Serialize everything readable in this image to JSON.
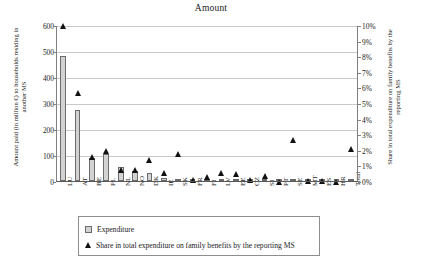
{
  "chart_data": {
    "type": "bar",
    "title": "Amount",
    "xlabel": "",
    "ylabel": "Amount paid (in million €) to households residing in another MS",
    "y2label": "Share in total expenditure on family benefits by the reporting MS",
    "grid": true,
    "legend_position": "bottom",
    "ylim": [
      0,
      600
    ],
    "y2lim": [
      0,
      10
    ],
    "yticks": [
      "0",
      "100",
      "200",
      "300",
      "400",
      "500",
      "600"
    ],
    "y2ticks": [
      "0%",
      "1%",
      "2%",
      "3%",
      "4%",
      "5%",
      "6%",
      "7%",
      "8%",
      "9%",
      "10%"
    ],
    "categories": [
      "LU",
      "AT",
      "BE",
      "PL",
      "NL",
      "NO",
      "DK",
      "IE",
      "SK",
      "FR",
      "FI",
      "LV",
      "EE",
      "CZ",
      "SI",
      "PT",
      "SE",
      "MT",
      "ES",
      "HR",
      "Total"
    ],
    "series": [
      {
        "name": "Expenditure",
        "axis": "left",
        "type": "bar",
        "values": [
          480,
          273,
          89,
          104,
          53,
          39,
          29,
          11,
          9,
          3,
          8,
          4,
          4,
          3,
          4,
          1,
          1,
          0.5,
          0.4,
          0.3,
          2
        ]
      },
      {
        "name": "Share in total expenditure on family benefits by the reporting MS",
        "axis": "right",
        "type": "scatter",
        "values": [
          10.0,
          5.7,
          1.6,
          2.0,
          0.8,
          0.8,
          1.4,
          0.6,
          1.8,
          0.1,
          0.3,
          0.55,
          0.5,
          0.1,
          0.4,
          0.02,
          2.7,
          0.05,
          0.04,
          0.03,
          2.1
        ]
      }
    ]
  },
  "legend": {
    "items": [
      {
        "label": "Expenditure",
        "marker": "square-swatch"
      },
      {
        "label": "Share in total expenditure on family benefits by the reporting MS",
        "marker": "triangle-marker"
      }
    ]
  }
}
